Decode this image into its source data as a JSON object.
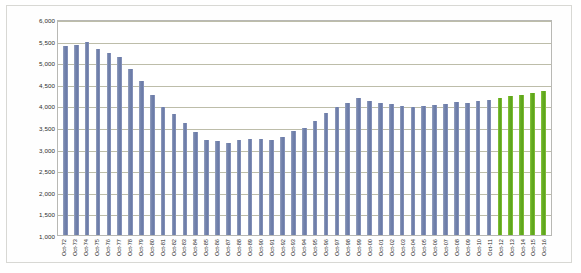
{
  "chart_data": {
    "type": "bar",
    "title": "",
    "subtitle": "",
    "xlabel": "",
    "ylabel": "",
    "ylim": [
      1000,
      6000
    ],
    "ytick_step": 500,
    "grid": true,
    "legend": "none",
    "ytick_labels": [
      "6,000",
      "5,500",
      "5,000",
      "4,500",
      "4,000",
      "3,500",
      "3,000",
      "2,500",
      "2,000",
      "1,500",
      "1,000"
    ],
    "ytick_values": [
      6000,
      5500,
      5000,
      4500,
      4000,
      3500,
      3000,
      2500,
      2000,
      1500,
      1000
    ],
    "categories": [
      "Oct-72",
      "Oct-73",
      "Oct-74",
      "Oct-75",
      "Oct-76",
      "Oct-77",
      "Oct-78",
      "Oct-79",
      "Oct-80",
      "Oct-81",
      "Oct-82",
      "Oct-83",
      "Oct-84",
      "Oct-85",
      "Oct-86",
      "Oct-87",
      "Oct-88",
      "Oct-89",
      "Oct-90",
      "Oct-91",
      "Oct-92",
      "Oct-93",
      "Oct-94",
      "Oct-95",
      "Oct-96",
      "Oct-97",
      "Oct-98",
      "Oct-99",
      "Oct-00",
      "Oct-01",
      "Oct-02",
      "Oct-03",
      "Oct-04",
      "Oct-05",
      "Oct-06",
      "Oct-07",
      "Oct-08",
      "Oct-09",
      "Oct-10",
      "Oct-11",
      "Oct-12",
      "Oct-13",
      "Oct-14",
      "Oct-15",
      "Oct-16"
    ],
    "values": [
      5420,
      5450,
      5510,
      5340,
      5260,
      5160,
      4870,
      4600,
      4270,
      3990,
      3820,
      3610,
      3400,
      3230,
      3190,
      3140,
      3210,
      3240,
      3250,
      3230,
      3290,
      3420,
      3510,
      3670,
      3850,
      3990,
      4090,
      4210,
      4120,
      4080,
      4060,
      4020,
      3980,
      4020,
      4040,
      4060,
      4100,
      4080,
      4120,
      4150,
      4200,
      4240,
      4280,
      4320,
      4360
    ],
    "bar_colors": [
      "#7282ac",
      "#7282ac",
      "#7282ac",
      "#7282ac",
      "#7282ac",
      "#7282ac",
      "#7282ac",
      "#7282ac",
      "#7282ac",
      "#7282ac",
      "#7282ac",
      "#7282ac",
      "#7282ac",
      "#7282ac",
      "#7282ac",
      "#7282ac",
      "#7282ac",
      "#7282ac",
      "#7282ac",
      "#7282ac",
      "#7282ac",
      "#7282ac",
      "#7282ac",
      "#7282ac",
      "#7282ac",
      "#7282ac",
      "#7282ac",
      "#7282ac",
      "#7282ac",
      "#7282ac",
      "#7282ac",
      "#7282ac",
      "#7282ac",
      "#7282ac",
      "#7282ac",
      "#7282ac",
      "#7282ac",
      "#7282ac",
      "#7282ac",
      "#7282ac",
      "#63ab20",
      "#63ab20",
      "#63ab20",
      "#63ab20",
      "#63ab20"
    ],
    "series_colors": {
      "historical": "#7282ac",
      "projected": "#63ab20"
    },
    "grid_color": "#b2b29a",
    "plot_border_color": "#b8b8b4",
    "background": "#ffffff"
  }
}
